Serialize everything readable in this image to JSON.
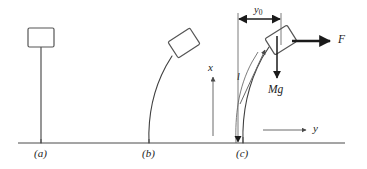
{
  "figure": {
    "domain": "diagram",
    "background_color": "#ffffff",
    "line_color": "#3a3a3a",
    "ink_color": "#1a1a1a",
    "panels": [
      {
        "id": "a",
        "label": "(a)",
        "state": "undeflected vertical rod with mass at top"
      },
      {
        "id": "b",
        "label": "(b)",
        "state": "rod bent to the right, mass tilted"
      },
      {
        "id": "c",
        "label": "(c)",
        "state": "rod bent with forces and coordinates annotated"
      }
    ],
    "annotations": {
      "dimension_y0": {
        "text": "y",
        "subscript": "0",
        "meaning": "horizontal tip deflection"
      },
      "arc_length_l": {
        "text": "l",
        "meaning": "rod length along the curve"
      },
      "force_F": {
        "text": "F",
        "meaning": "applied horizontal force at the tip"
      },
      "weight_Mg": {
        "text": "Mg",
        "meaning": "weight of the end mass"
      },
      "axis_x": {
        "text": "x",
        "direction": "up"
      },
      "axis_y": {
        "text": "y",
        "direction": "right"
      }
    },
    "ground_line": {
      "present": true,
      "y": 143
    }
  }
}
